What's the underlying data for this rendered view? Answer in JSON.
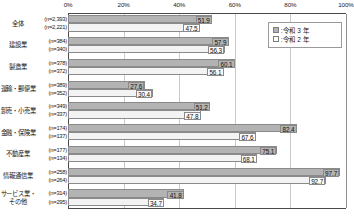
{
  "chart_data": {
    "type": "bar",
    "orientation": "horizontal",
    "title": "",
    "xlabel": "",
    "ylabel": "",
    "xlim": [
      0,
      100
    ],
    "xticks": [
      "0%",
      "20%",
      "40%",
      "60%",
      "80%",
      "100%"
    ],
    "xtick_values": [
      0,
      20,
      40,
      60,
      80,
      100
    ],
    "grid": true,
    "legend_position": "top-right",
    "categories": [
      "全体",
      "建設業",
      "製造業",
      "運輸・郵便業",
      "卸売・小売業",
      "金融・保険業",
      "不動産業",
      "情報通信業",
      "サービス業・\nその他"
    ],
    "sample_sizes": [
      [
        "(n=2,393)",
        "(n=2,221)"
      ],
      [
        "(n=384)",
        "(n=340)"
      ],
      [
        "(n=378)",
        "(n=372)"
      ],
      [
        "(n=389)",
        "(n=352)"
      ],
      [
        "(n=349)",
        "(n=337)"
      ],
      [
        "(n=174)",
        "(n=137)"
      ],
      [
        "(n=177)",
        "(n=134)"
      ],
      [
        "(n=258)",
        "(n=264)"
      ],
      [
        "(n=314)",
        "(n=295)"
      ]
    ],
    "series": [
      {
        "name": "令和3年",
        "color": "#b3b3b3",
        "values": [
          51.9,
          57.9,
          60.1,
          27.6,
          51.2,
          82.4,
          75.1,
          97.7,
          41.8
        ]
      },
      {
        "name": "令和2年",
        "color": "#f3f3f3",
        "values": [
          47.5,
          56.3,
          56.1,
          30.4,
          47.8,
          67.6,
          68.1,
          92.7,
          34.7
        ]
      }
    ]
  },
  "legend": {
    "items": [
      {
        "label": "令和 3 年",
        "colon": ":"
      },
      {
        "label": "令和 2 年",
        "colon": ":"
      }
    ]
  }
}
